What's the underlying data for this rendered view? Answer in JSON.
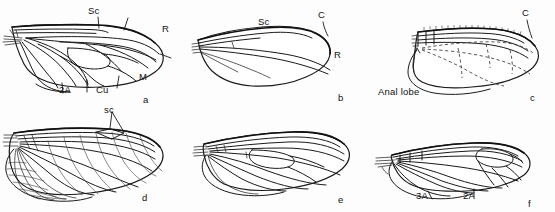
{
  "figure": {
    "background_color": "#fdfdfd",
    "ink_color": "#1a1a1a",
    "width": 555,
    "height": 212
  },
  "panels": [
    {
      "id": "a",
      "letter": "a",
      "labels": [
        {
          "text": "Sc",
          "name": "vein-label-sc"
        },
        {
          "text": "R",
          "name": "vein-label-r"
        },
        {
          "text": "M",
          "name": "vein-label-m"
        },
        {
          "text": "Cu",
          "name": "vein-label-cu"
        },
        {
          "text": "2A",
          "name": "vein-label-2a"
        }
      ]
    },
    {
      "id": "b",
      "letter": "b",
      "labels": [
        {
          "text": "Sc",
          "name": "vein-label-sc"
        },
        {
          "text": "C",
          "name": "vein-label-c"
        },
        {
          "text": "R",
          "name": "vein-label-r"
        }
      ]
    },
    {
      "id": "c",
      "letter": "c",
      "labels": [
        {
          "text": "C",
          "name": "vein-label-c"
        },
        {
          "text": "Anal lobe",
          "name": "region-label-anal-lobe"
        }
      ]
    },
    {
      "id": "d",
      "letter": "d",
      "labels": [
        {
          "text": "sc",
          "name": "vein-label-sc"
        }
      ]
    },
    {
      "id": "e",
      "letter": "e",
      "labels": []
    },
    {
      "id": "f",
      "letter": "f",
      "labels": [
        {
          "text": "3A",
          "name": "vein-label-3a"
        },
        {
          "text": "2A",
          "name": "vein-label-2a"
        }
      ]
    }
  ],
  "text": {
    "a": {
      "sc": "Sc",
      "r": "R",
      "m": "M",
      "cu": "Cu",
      "a2": "2A",
      "letter": "a"
    },
    "b": {
      "sc": "Sc",
      "c": "C",
      "r": "R",
      "letter": "b"
    },
    "c": {
      "c": "C",
      "anal_lobe": "Anal lobe",
      "letter": "c"
    },
    "d": {
      "sc": "sc",
      "letter": "d"
    },
    "e": {
      "letter": "e"
    },
    "f": {
      "a3": "3A",
      "a2": "2A",
      "letter": "f"
    }
  }
}
